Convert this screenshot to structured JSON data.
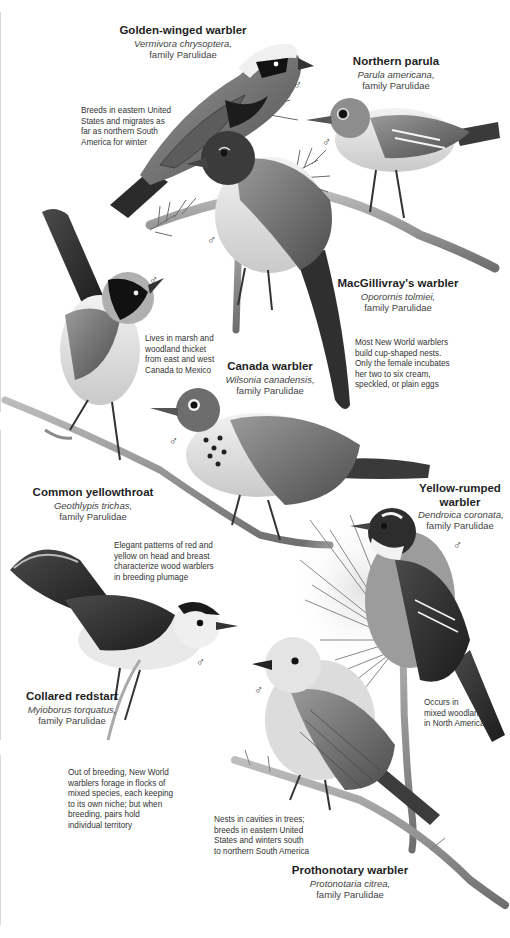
{
  "page": {
    "background": "#ffffff",
    "ink_color": "#222222",
    "palette": "grayscale"
  },
  "species": [
    {
      "id": "golden-winged",
      "common": "Golden-winged warbler",
      "scientific": "Vermivora chrysoptera,",
      "family": "family Parulidae"
    },
    {
      "id": "northern-parula",
      "common": "Northern parula",
      "scientific": "Parula americana,",
      "family": "family Parulidae"
    },
    {
      "id": "macgillivray",
      "common": "MacGillivray's warbler",
      "scientific": "Oporornis tolmiei,",
      "family": "family Parulidae"
    },
    {
      "id": "canada",
      "common": "Canada warbler",
      "scientific": "Wilsonia canadensis,",
      "family": "family Parulidae"
    },
    {
      "id": "yellowthroat",
      "common": "Common yellowthroat",
      "scientific": "Geothlypis trichas,",
      "family": "family Parulidae"
    },
    {
      "id": "yellow-rumped",
      "common": "Yellow-rumped warbler",
      "common_line1": "Yellow-rumped",
      "common_line2": "warbler",
      "scientific": "Dendroica coronata,",
      "family": "family Parulidae"
    },
    {
      "id": "collared-redstart",
      "common": "Collared redstart",
      "scientific": "Myioborus torquatus,",
      "family": "family Parulidae"
    },
    {
      "id": "prothonotary",
      "common": "Prothonotary warbler",
      "scientific": "Protonotaria citrea,",
      "family": "family Parulidae"
    }
  ],
  "notes": [
    {
      "id": "golden-winged-range",
      "lines": [
        "Breeds in eastern United",
        "States and migrates as",
        "far as northern South",
        "America for winter"
      ]
    },
    {
      "id": "nests",
      "lines": [
        "Most New World warblers",
        "build cup-shaped nests.",
        "Only the female incubates",
        "her two to six cream,",
        "speckled, or plain eggs"
      ]
    },
    {
      "id": "yellowthroat-habitat",
      "lines": [
        "Lives in marsh and",
        "woodland thicket",
        "from east and west",
        "Canada to Mexico"
      ]
    },
    {
      "id": "plumage",
      "lines": [
        "Elegant patterns of red and",
        "yellow on head and breast",
        "characterize wood warblers",
        "in breeding plumage"
      ]
    },
    {
      "id": "yellow-rumped-habitat",
      "lines": [
        "Occurs in",
        "mixed woodland",
        "in North America"
      ]
    },
    {
      "id": "foraging",
      "lines": [
        "Out of breeding, New World",
        "warblers forage in flocks of",
        "mixed species, each keeping",
        "to its own niche; but when",
        "breeding, pairs hold",
        "individual territory"
      ]
    },
    {
      "id": "prothonotary-range",
      "lines": [
        "Nests in cavities in trees;",
        "breeds in eastern United",
        "States and winters south",
        "to northern South America"
      ]
    }
  ],
  "symbols": {
    "male": "♂"
  }
}
